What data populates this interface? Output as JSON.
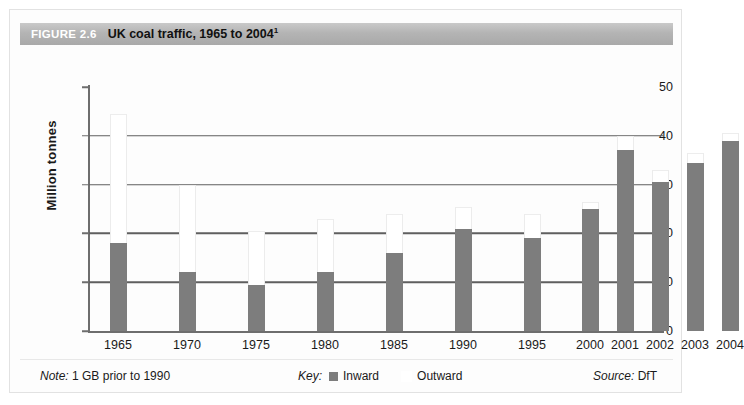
{
  "figure": {
    "number_label": "FIGURE 2.6",
    "title": "UK coal traffic, 1965 to 2004",
    "title_superscript": "1"
  },
  "footer": {
    "note_prefix": "Note:",
    "note_text": "1 GB prior to 1990",
    "key_label": "Key:",
    "source_prefix": "Source:",
    "source_text": "DfT"
  },
  "colors": {
    "inward": "#7d7d7d",
    "outward": "#ffffff",
    "titlebar": "#b4b4b4",
    "gridline": "#5f5f5f",
    "axis": "#6e6e6e"
  },
  "chart_data": {
    "type": "bar",
    "title": "UK coal traffic, 1965 to 2004",
    "xlabel": "",
    "ylabel": "Million tonnes",
    "ylim": [
      0,
      50
    ],
    "yticks": [
      0,
      10,
      20,
      30,
      40,
      50
    ],
    "grid": true,
    "stacked": true,
    "legend_position": "bottom-center",
    "categories": [
      "1965",
      "1970",
      "1975",
      "1980",
      "1985",
      "1990",
      "1995",
      "2000",
      "2001",
      "2002",
      "2003",
      "2004"
    ],
    "series": [
      {
        "name": "Inward",
        "color": "#7d7d7d",
        "values": [
          18.0,
          12.0,
          9.5,
          12.0,
          16.0,
          21.0,
          19.0,
          25.0,
          37.0,
          30.5,
          34.5,
          39.0
        ]
      },
      {
        "name": "Outward",
        "color": "#ffffff",
        "values": [
          26.5,
          18.0,
          11.0,
          11.0,
          8.0,
          4.5,
          5.0,
          1.5,
          3.0,
          2.5,
          2.0,
          1.5
        ]
      }
    ],
    "totals": [
      44.5,
      30.0,
      20.5,
      23.0,
      24.0,
      25.5,
      24.0,
      26.5,
      40.0,
      33.0,
      36.5,
      40.5
    ]
  }
}
